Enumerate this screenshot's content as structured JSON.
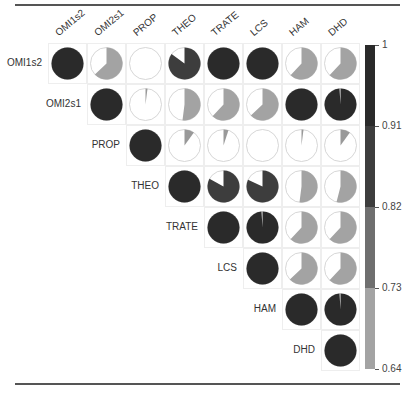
{
  "chart_data": {
    "type": "heatmap",
    "subtype": "correlation-pie-matrix (upper triangle)",
    "title": "",
    "variables": [
      "OMI1s2",
      "OMI2s1",
      "PROP",
      "THEO",
      "TRATE",
      "LCS",
      "HAM",
      "DHD"
    ],
    "matrix": [
      [
        1.0,
        0.63,
        0.0,
        0.85,
        1.0,
        1.0,
        0.62,
        0.62
      ],
      [
        null,
        1.0,
        0.02,
        0.52,
        0.62,
        0.63,
        1.0,
        0.99
      ],
      [
        null,
        null,
        1.0,
        0.1,
        0.05,
        0.0,
        0.02,
        0.1
      ],
      [
        null,
        null,
        null,
        1.0,
        0.83,
        0.82,
        0.52,
        0.54
      ],
      [
        null,
        null,
        null,
        null,
        1.0,
        0.99,
        0.62,
        0.62
      ],
      [
        null,
        null,
        null,
        null,
        null,
        1.0,
        0.63,
        0.62
      ],
      [
        null,
        null,
        null,
        null,
        null,
        null,
        1.0,
        0.99
      ],
      [
        null,
        null,
        null,
        null,
        null,
        null,
        null,
        1.0
      ]
    ],
    "colorbar": {
      "ticks": [
        "1",
        "0.91",
        "0.82",
        "0.73",
        "0.64"
      ],
      "range": [
        0.64,
        1
      ],
      "bands": [
        {
          "from": 0.91,
          "to": 1.0,
          "color": "#2a2a2a"
        },
        {
          "from": 0.82,
          "to": 0.91,
          "color": "#3d3d3d"
        },
        {
          "from": 0.73,
          "to": 0.82,
          "color": "#6f6f6f"
        },
        {
          "from": 0.64,
          "to": 0.73,
          "color": "#a3a3a3"
        }
      ]
    },
    "grid": true,
    "legend_position": "right"
  }
}
